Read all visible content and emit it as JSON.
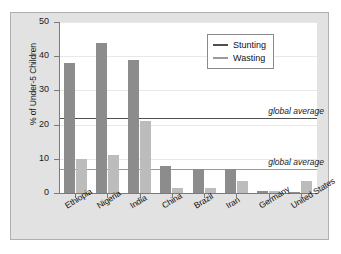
{
  "chart_data": {
    "type": "bar",
    "title": "",
    "xlabel": "",
    "ylabel": "% of Under-5 Children",
    "ylim": [
      0,
      50
    ],
    "yticks": [
      0,
      10,
      20,
      30,
      40,
      50
    ],
    "grid": true,
    "legend_position": "top-right",
    "categories": [
      "Ethiopia",
      "Nigeria",
      "India",
      "China",
      "Brazil",
      "Iran",
      "Germany",
      "United States"
    ],
    "series": [
      {
        "name": "Stunting",
        "color": "#8c8c8c",
        "values": [
          38,
          44,
          39,
          8,
          7,
          7,
          0.5,
          0.3
        ]
      },
      {
        "name": "Wasting",
        "color": "#bcbcbc",
        "values": [
          10,
          11,
          21,
          1.5,
          1.5,
          3.5,
          0.5,
          3.5
        ]
      }
    ],
    "reference_lines": [
      {
        "name": "Stunting",
        "label": "global average",
        "value": 22,
        "color": "#4f4f4f"
      },
      {
        "name": "Wasting",
        "label": "global average",
        "value": 7,
        "color": "#9a9a9a"
      }
    ]
  },
  "legend": {
    "items": [
      {
        "label": "Stunting"
      },
      {
        "label": "Wasting"
      }
    ]
  },
  "axis": {
    "y_title": "% of Under-5 Children",
    "y_tick_labels": [
      "50",
      "40",
      "30",
      "20",
      "10",
      "0"
    ]
  },
  "annotations": {
    "stunting_average": "global average",
    "wasting_average": "global average"
  }
}
